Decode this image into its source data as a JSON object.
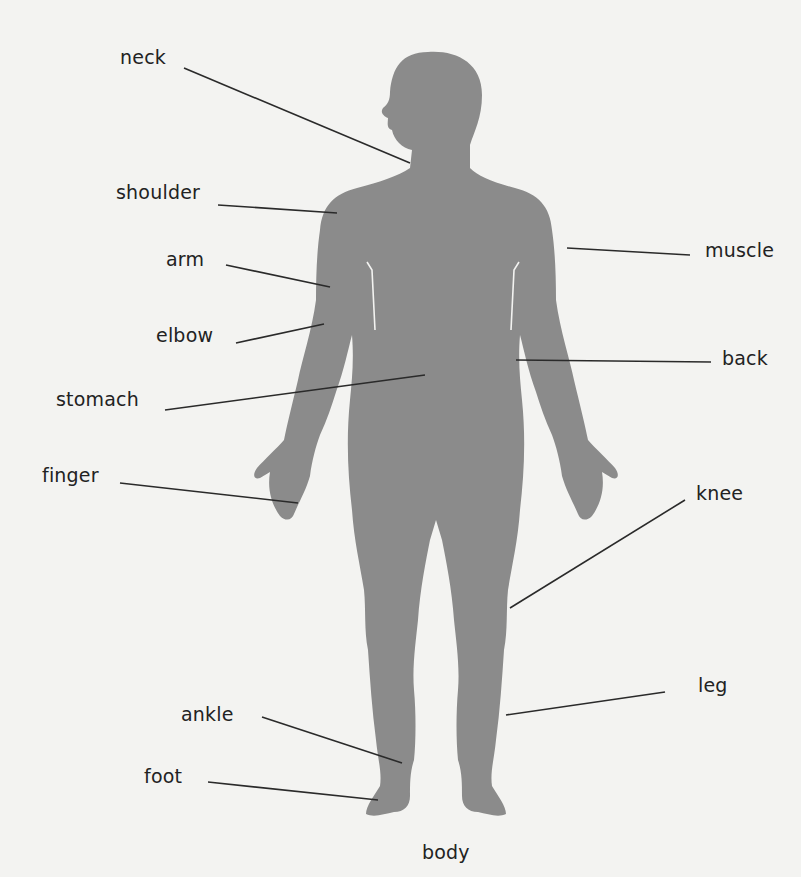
{
  "diagram": {
    "title": "body",
    "colors": {
      "background": "#f3f3f1",
      "silhouette": "#8b8b8b",
      "text": "#222222",
      "leader_line": "#2a2a2a"
    },
    "labels": {
      "neck": "neck",
      "shoulder": "shoulder",
      "arm": "arm",
      "elbow": "elbow",
      "stomach": "stomach",
      "finger": "finger",
      "ankle": "ankle",
      "foot": "foot",
      "muscle": "muscle",
      "back": "back",
      "knee": "knee",
      "leg": "leg"
    }
  }
}
